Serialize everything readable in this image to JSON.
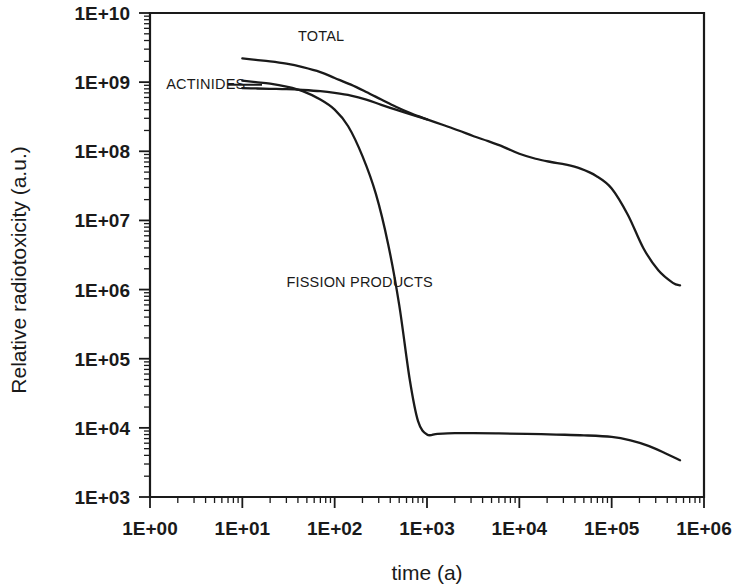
{
  "chart_data": {
    "type": "line",
    "title": "",
    "xlabel": "time (a)",
    "ylabel": "Relative radiotoxicity (a.u.)",
    "xscale": "log",
    "yscale": "log",
    "xlim": [
      1,
      1000000
    ],
    "ylim": [
      1000,
      10000000000
    ],
    "grid": false,
    "legend_position": "inline-annotations",
    "x_tick_labels": [
      "1E+00",
      "1E+01",
      "1E+02",
      "1E+03",
      "1E+04",
      "1E+05",
      "1E+06"
    ],
    "x_tick_values": [
      1,
      10,
      100,
      1000,
      10000,
      100000,
      1000000
    ],
    "y_tick_labels": [
      "1E+03",
      "1E+04",
      "1E+05",
      "1E+06",
      "1E+07",
      "1E+08",
      "1E+09",
      "1E+10"
    ],
    "y_tick_values": [
      1000,
      10000,
      100000,
      1000000,
      10000000,
      100000000,
      1000000000,
      10000000000
    ],
    "minor_ticks": true,
    "series": [
      {
        "name": "TOTAL",
        "label": "TOTAL",
        "x": [
          10,
          14,
          20,
          30,
          45,
          70,
          100,
          150,
          220,
          320,
          460,
          680,
          1000,
          1500,
          2200,
          3200,
          4600,
          6800,
          10000,
          15000,
          22000,
          32000,
          46000,
          68000,
          100000,
          150000,
          220000,
          320000,
          460000,
          550000
        ],
        "y": [
          2200000000.0,
          2100000000.0,
          2000000000.0,
          1850000000.0,
          1650000000.0,
          1400000000.0,
          1150000000.0,
          920000000.0,
          720000000.0,
          560000000.0,
          440000000.0,
          350000000.0,
          290000000.0,
          240000000.0,
          200000000.0,
          165000000.0,
          140000000.0,
          115000000.0,
          92000000.0,
          78000000.0,
          70000000.0,
          64000000.0,
          56000000.0,
          44000000.0,
          29000000.0,
          12000000.0,
          4000000.0,
          1900000.0,
          1250000.0,
          1150000.0
        ]
      },
      {
        "name": "ACTINIDES",
        "label": "ACTINIDES",
        "x": [
          10,
          14,
          20,
          30,
          45,
          70,
          100,
          150,
          220,
          320,
          460,
          680,
          1000
        ],
        "y": [
          820000000.0,
          810000000.0,
          800000000.0,
          790000000.0,
          770000000.0,
          740000000.0,
          700000000.0,
          640000000.0,
          560000000.0,
          470000000.0,
          400000000.0,
          340000000.0,
          290000000.0
        ]
      },
      {
        "name": "FISSION PRODUCTS",
        "label": "FISSION PRODUCTS",
        "x": [
          10,
          14,
          20,
          30,
          45,
          70,
          100,
          140,
          200,
          280,
          380,
          500,
          650,
          800,
          1000,
          1300,
          2000,
          3200,
          6000,
          12000,
          25000,
          50000,
          100000,
          160000,
          250000,
          380000,
          550000
        ],
        "y": [
          1050000000.0,
          1000000000.0,
          950000000.0,
          860000000.0,
          740000000.0,
          560000000.0,
          400000000.0,
          230000000.0,
          85000000.0,
          24000000.0,
          4500000.0,
          600000.0,
          50000.0,
          12500.0,
          8000.0,
          8200.0,
          8400.0,
          8400.0,
          8300.0,
          8200.0,
          8000.0,
          7800.0,
          7400.0,
          6600.0,
          5500.0,
          4300.0,
          3400.0
        ]
      }
    ],
    "annotations": [
      {
        "text": "TOTAL",
        "x": 40,
        "y": 4000000000.0,
        "has_leader": false
      },
      {
        "text": "ACTINIDES",
        "x": 1.5,
        "y": 800000000.0,
        "has_leader": true
      },
      {
        "text": "FISSION PRODUCTS",
        "x": 30,
        "y": 1100000.0,
        "has_leader": false
      }
    ]
  },
  "axes": {
    "x_title": "time (a)",
    "y_title": "Relative radiotoxicity (a.u.)"
  }
}
